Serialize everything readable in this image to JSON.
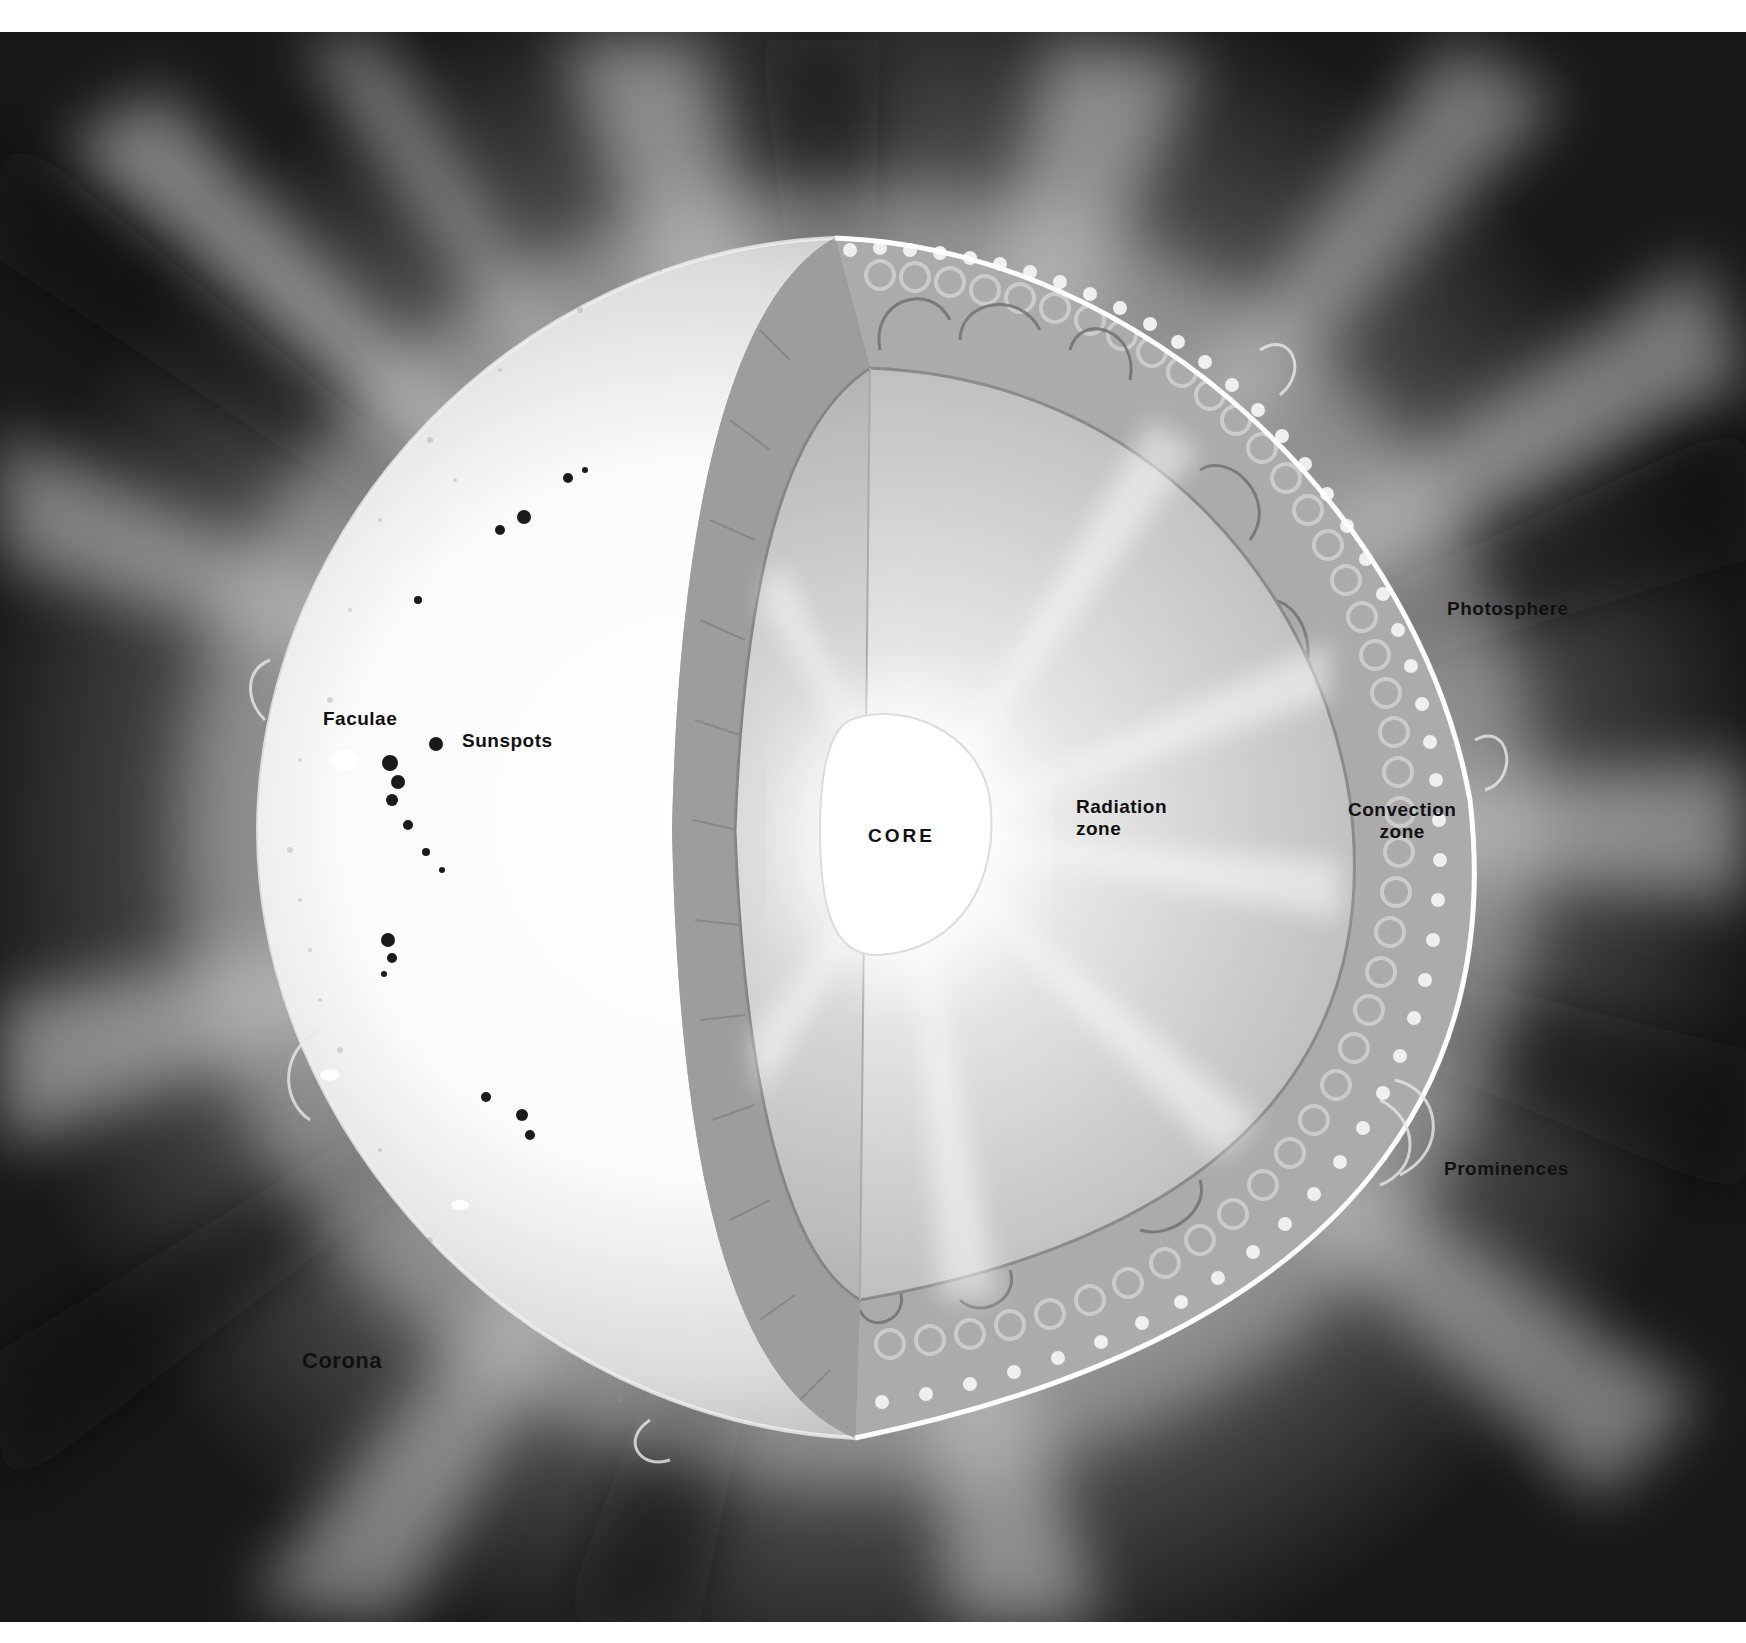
{
  "diagram": {
    "labels": {
      "faculae": "Faculae",
      "sunspots": "Sunspots",
      "photosphere": "Photosphere",
      "core": "CORE",
      "radiation_zone_line1": "Radiation",
      "radiation_zone_line2": "zone",
      "convection_zone_line1": "Convection",
      "convection_zone_line2": "zone",
      "prominences": "Prominences",
      "corona": "Corona"
    },
    "colors": {
      "background_dark": "#141414",
      "corona_glow": "#9a9a9a",
      "surface": "#f4f4f4",
      "radiation_zone": "#c8c8c8",
      "convection_zone": "#a9a9a9",
      "core": "#ffffff",
      "label_text": "#111111"
    }
  }
}
